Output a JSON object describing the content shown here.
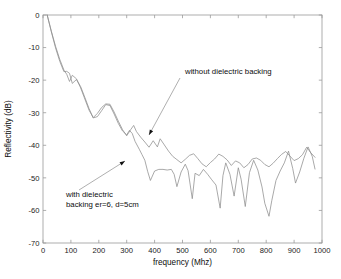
{
  "chart_data": {
    "type": "line",
    "title": "",
    "xlabel": "frequency (Mhz)",
    "ylabel": "Reflectivity (dB)",
    "xlim": [
      0,
      1000
    ],
    "ylim": [
      -70,
      0
    ],
    "xticks": [
      0,
      100,
      200,
      300,
      400,
      500,
      600,
      700,
      800,
      900,
      1000
    ],
    "xtick_labels": [
      "0",
      "100",
      "200",
      "300",
      "400",
      "500",
      "600",
      "700",
      "800",
      "900",
      "1000"
    ],
    "yticks": [
      0,
      -10,
      -20,
      -30,
      -40,
      -50,
      -60,
      -70
    ],
    "ytick_labels": [
      "0",
      "-10",
      "-20",
      "-30",
      "-40",
      "-50",
      "-60",
      "-70"
    ],
    "grid": false,
    "legend": "none",
    "line_color": "#8c8c8c",
    "frame_color": "#9a9a9a",
    "series": [
      {
        "name": "without dielectric backing",
        "color": "#8c8c8c",
        "x": [
          15,
          30,
          45,
          60,
          75,
          85,
          95,
          105,
          120,
          135,
          150,
          165,
          180,
          195,
          210,
          225,
          240,
          255,
          270,
          285,
          300,
          315,
          325,
          335,
          350,
          365,
          380,
          395,
          410,
          420,
          435,
          450,
          465,
          480,
          495,
          510,
          525,
          540,
          555,
          570,
          585,
          600,
          615,
          630,
          645,
          660,
          675,
          690,
          705,
          720,
          735,
          750,
          765,
          780,
          795,
          810,
          825,
          840,
          855,
          870,
          885,
          900,
          915,
          930,
          945,
          960,
          975
        ],
        "y": [
          0.0,
          -5.0,
          -9.6,
          -13.6,
          -16.9,
          -18.2,
          -20.4,
          -18.5,
          -19.6,
          -22.4,
          -25.8,
          -29.2,
          -31.5,
          -30.2,
          -28.4,
          -27.3,
          -27.4,
          -29.8,
          -32.6,
          -35.2,
          -37.1,
          -35.1,
          -33.9,
          -35.8,
          -37.5,
          -39.0,
          -40.6,
          -38.6,
          -40.5,
          -38.0,
          -39.9,
          -41.8,
          -43.4,
          -44.4,
          -45.4,
          -44.3,
          -43.1,
          -42.6,
          -44.1,
          -45.7,
          -46.6,
          -45.3,
          -44.2,
          -42.7,
          -43.4,
          -44.5,
          -46.2,
          -44.8,
          -45.4,
          -46.9,
          -45.9,
          -44.2,
          -43.9,
          -44.6,
          -45.9,
          -46.6,
          -45.5,
          -44.1,
          -42.8,
          -41.9,
          -43.3,
          -44.7,
          -44.1,
          -42.9,
          -40.6,
          -42.3,
          -43.7
        ]
      },
      {
        "name": "with dielectric backing er=6, d=5cm",
        "color": "#8c8c8c",
        "x": [
          15,
          30,
          45,
          60,
          75,
          85,
          95,
          105,
          120,
          135,
          150,
          165,
          180,
          195,
          210,
          225,
          240,
          255,
          270,
          285,
          300,
          310,
          320,
          330,
          345,
          355,
          365,
          375,
          385,
          400,
          415,
          430,
          445,
          460,
          470,
          480,
          495,
          510,
          520,
          535,
          545,
          560,
          575,
          590,
          605,
          620,
          635,
          645,
          655,
          670,
          685,
          700,
          710,
          725,
          740,
          755,
          770,
          785,
          795,
          810,
          820,
          835,
          850,
          865,
          880,
          895,
          905,
          920,
          935,
          950,
          965,
          975
        ],
        "y": [
          0.0,
          -5.2,
          -10.1,
          -14.2,
          -17.4,
          -17.3,
          -17.9,
          -21.0,
          -19.8,
          -22.0,
          -25.3,
          -28.7,
          -31.6,
          -31.2,
          -29.4,
          -27.5,
          -27.8,
          -30.4,
          -33.3,
          -35.6,
          -36.8,
          -35.4,
          -36.4,
          -38.8,
          -41.2,
          -42.9,
          -44.6,
          -48.0,
          -50.8,
          -47.9,
          -47.4,
          -47.4,
          -47.6,
          -47.4,
          -48.9,
          -52.7,
          -48.2,
          -45.8,
          -47.8,
          -56.4,
          -48.6,
          -49.3,
          -47.4,
          -48.9,
          -50.6,
          -52.2,
          -59.3,
          -49.3,
          -45.4,
          -48.9,
          -55.6,
          -46.9,
          -50.4,
          -58.8,
          -48.4,
          -44.6,
          -47.6,
          -52.8,
          -57.8,
          -61.8,
          -57.0,
          -50.8,
          -47.9,
          -45.4,
          -41.8,
          -47.1,
          -51.6,
          -48.2,
          -44.0,
          -40.5,
          -43.4,
          -47.3
        ]
      }
    ],
    "annotations": [
      {
        "id": "annotation-without-backing",
        "text_lines": [
          "without dielectric backing"
        ],
        "text_x": 185,
        "text_y": 74,
        "leader_from_x": 180,
        "leader_from_y": 78,
        "leader_to_x": 149,
        "leader_to_y": 135
      },
      {
        "id": "annotation-with-backing",
        "text_lines": [
          "with dielectric",
          "backing er=6, d=5cm"
        ],
        "text_x": 66,
        "text_y": 197,
        "leader_from_x": 79,
        "leader_from_y": 190,
        "leader_to_x": 125,
        "leader_to_y": 161
      }
    ]
  },
  "plot_box": {
    "left": 43,
    "right": 322,
    "top": 15,
    "bottom": 243
  }
}
